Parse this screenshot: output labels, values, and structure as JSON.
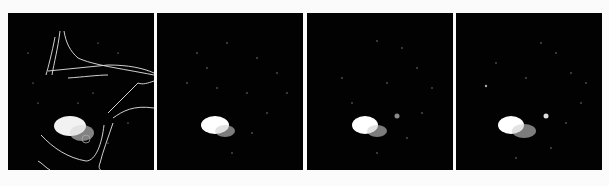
{
  "figure": {
    "background": "#fbfbfb",
    "panels": [
      {
        "id": "panel-1",
        "description": "Grayscale scan with white outline contours overlaid and a bright blob on the lower-left",
        "has_contour_overlay": true,
        "blob_color": "#ffffff",
        "contour_color": "#e8e8e8"
      },
      {
        "id": "panel-2",
        "description": "Dark scan with scattered speckles and a bright blob on the lower-left",
        "has_contour_overlay": false,
        "blob_color": "#ffffff"
      },
      {
        "id": "panel-3",
        "description": "Dark scan with scattered speckles, bright blob on the lower-left and a faint spot to the right",
        "has_contour_overlay": false,
        "blob_color": "#ffffff"
      },
      {
        "id": "panel-4",
        "description": "Dark scan with scattered speckles, bright blob on the lower-left and a small bright spot to the right",
        "has_contour_overlay": false,
        "blob_color": "#ffffff"
      }
    ]
  }
}
